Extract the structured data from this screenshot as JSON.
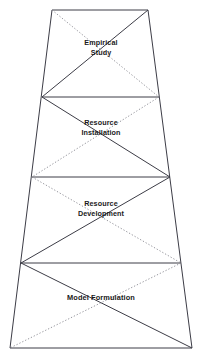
{
  "diagram": {
    "type": "truncated-pyramid-layered-diagram",
    "title": "",
    "background_color": "#ffffff",
    "line_color": "#3c3c46",
    "dotted_line_color": "#8a8a92",
    "text_color": "#1a1a1a",
    "canvas": {
      "width": 202,
      "height": 358
    },
    "geometry": {
      "levels_y": [
        10,
        97,
        177,
        263,
        348
      ],
      "left_x": [
        52,
        42,
        32,
        21,
        10
      ],
      "right_x": [
        148,
        159,
        170,
        181,
        192
      ]
    },
    "layers": [
      {
        "index": 1,
        "label": "Empirical\nStudy",
        "label_lines": [
          "Empirical",
          "Study"
        ],
        "solid_diagonal": "top-right-to-bottom-left",
        "dotted_diagonal": "top-left-to-bottom-right"
      },
      {
        "index": 2,
        "label": "Resource\nInstallation",
        "label_lines": [
          "Resource",
          "Installation"
        ],
        "solid_diagonal": "top-left-to-bottom-right",
        "dotted_diagonal": "top-right-to-bottom-left"
      },
      {
        "index": 3,
        "label": "Resource\nDevelopment",
        "label_lines": [
          "Resource",
          "Development"
        ],
        "solid_diagonal": "top-right-to-bottom-left",
        "dotted_diagonal": "top-left-to-bottom-right"
      },
      {
        "index": 4,
        "label": "Model Formulation",
        "label_lines": [
          "Model Formulation"
        ],
        "solid_diagonal": "top-left-to-bottom-right",
        "dotted_diagonal": "top-right-to-bottom-left"
      }
    ]
  }
}
